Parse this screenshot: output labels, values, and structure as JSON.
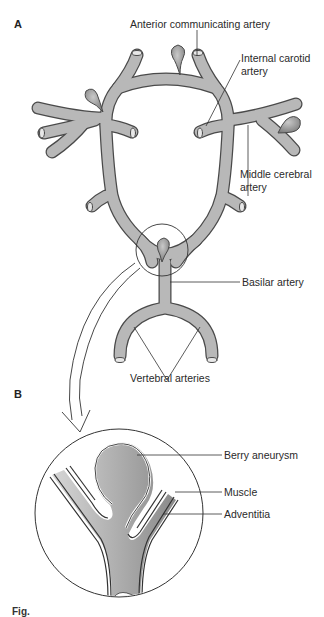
{
  "figure": {
    "panel_a": {
      "label": "A",
      "labels": {
        "anterior_communicating": "Anterior communicating artery",
        "internal_carotid_1": "Internal carotid",
        "internal_carotid_2": "artery",
        "middle_cerebral_1": "Middle cerebral",
        "middle_cerebral_2": "artery",
        "basilar": "Basilar artery",
        "vertebral": "Vertebral arteries"
      }
    },
    "panel_b": {
      "label": "B",
      "labels": {
        "berry_aneurysm": "Berry aneurysm",
        "muscle": "Muscle",
        "adventitia": "Adventitia"
      }
    },
    "caption": "Fig."
  },
  "colors": {
    "vessel_fill": "#b8b8b8",
    "vessel_stroke": "#4a4a4a",
    "aneurysm_fill": "#8f8f8f",
    "line": "#333333",
    "background": "#ffffff"
  }
}
